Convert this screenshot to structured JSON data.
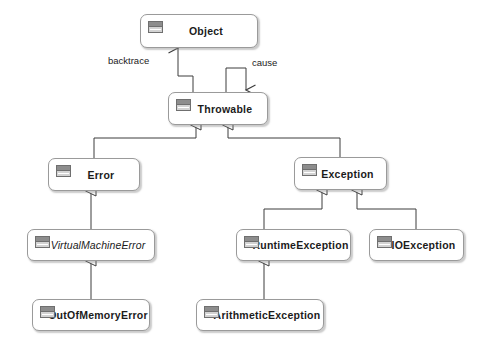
{
  "diagram": {
    "type": "uml-class-diagram",
    "background_color": "#ffffff",
    "node_fill": "#ffffff",
    "node_border": "#9a9a9a",
    "edge_color": "#3c3c3c",
    "icon_name": "uml-class-icon"
  },
  "nodes": [
    {
      "id": "object",
      "label": "Object",
      "abstract": false,
      "x": 140,
      "y": 14,
      "w": 118,
      "h": 34
    },
    {
      "id": "throwable",
      "label": "Throwable",
      "abstract": false,
      "x": 168,
      "y": 92,
      "w": 100,
      "h": 33
    },
    {
      "id": "error",
      "label": "Error",
      "abstract": false,
      "x": 48,
      "y": 158,
      "w": 92,
      "h": 33
    },
    {
      "id": "exception",
      "label": "Exception",
      "abstract": false,
      "x": 294,
      "y": 157,
      "w": 93,
      "h": 33
    },
    {
      "id": "virtualmachineerror",
      "label": "VirtualMachineError",
      "abstract": true,
      "x": 27,
      "y": 229,
      "w": 128,
      "h": 32
    },
    {
      "id": "runtimeexception",
      "label": "RuntimeException",
      "abstract": false,
      "x": 236,
      "y": 229,
      "w": 115,
      "h": 32
    },
    {
      "id": "ioexception",
      "label": "IOException",
      "abstract": false,
      "x": 369,
      "y": 229,
      "w": 95,
      "h": 32
    },
    {
      "id": "outofmemoryerror",
      "label": "OutOfMemoryError",
      "abstract": false,
      "x": 32,
      "y": 299,
      "w": 118,
      "h": 32
    },
    {
      "id": "arithmeticexception",
      "label": "ArithmeticException",
      "abstract": false,
      "x": 196,
      "y": 299,
      "w": 128,
      "h": 32
    }
  ],
  "edge_labels": [
    {
      "id": "backtrace",
      "text": "backtrace",
      "x": 108,
      "y": 55
    },
    {
      "id": "cause",
      "text": "cause",
      "x": 252,
      "y": 57
    }
  ],
  "relationships": [
    {
      "from": "throwable",
      "to": "object",
      "type": "association",
      "label": "backtrace"
    },
    {
      "from": "throwable",
      "to": "throwable",
      "type": "association",
      "label": "cause"
    },
    {
      "from": "error",
      "to": "throwable",
      "type": "generalization"
    },
    {
      "from": "exception",
      "to": "throwable",
      "type": "generalization"
    },
    {
      "from": "virtualmachineerror",
      "to": "error",
      "type": "generalization"
    },
    {
      "from": "runtimeexception",
      "to": "exception",
      "type": "generalization"
    },
    {
      "from": "ioexception",
      "to": "exception",
      "type": "generalization"
    },
    {
      "from": "outofmemoryerror",
      "to": "virtualmachineerror",
      "type": "generalization"
    },
    {
      "from": "arithmeticexception",
      "to": "runtimeexception",
      "type": "generalization"
    }
  ]
}
